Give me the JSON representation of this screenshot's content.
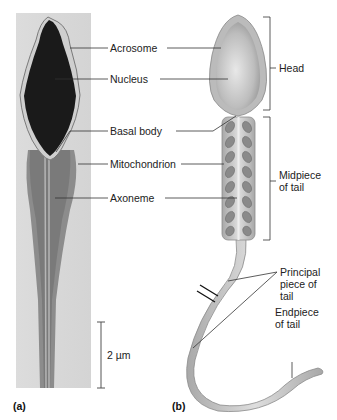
{
  "figure": {
    "panels": [
      {
        "id": "a",
        "label": "(a)",
        "type": "micrograph"
      },
      {
        "id": "b",
        "label": "(b)",
        "type": "illustration"
      }
    ],
    "labels": {
      "acrosome": "Acrosome",
      "nucleus": "Nucleus",
      "basal_body": "Basal body",
      "mitochondrion": "Mitochondrion",
      "axoneme": "Axoneme",
      "head": "Head",
      "midpiece_1": "Midpiece",
      "midpiece_2": "of tail",
      "principal_1": "Principal",
      "principal_2": "piece of",
      "principal_3": "tail",
      "endpiece_1": "Endpiece",
      "endpiece_2": "of tail"
    },
    "scale_bar": {
      "label": "2 µm"
    },
    "colors": {
      "micrograph_bg": "#d9d9d9",
      "nucleus_dark": "#1a1a1a",
      "drawing_fill": "#c8c8c8",
      "mito": "#8a8a8a",
      "line": "#333333"
    }
  }
}
